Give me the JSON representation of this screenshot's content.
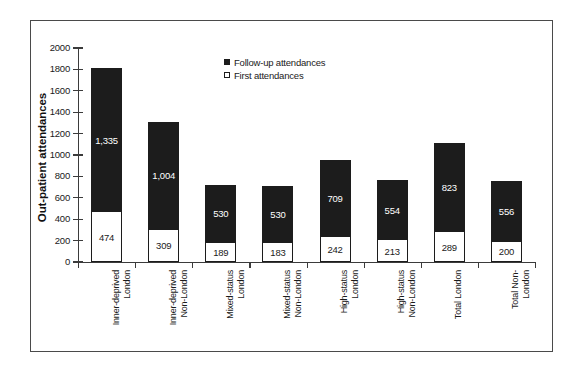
{
  "chart_data": {
    "type": "bar",
    "subtype": "stacked-vertical",
    "title": "",
    "xlabel": "",
    "ylabel": "Out-patient attendances",
    "ylim": [
      0,
      2000
    ],
    "ytick_step": 200,
    "yticks": [
      "0",
      "200",
      "400",
      "600",
      "800",
      "1000",
      "1200",
      "1400",
      "1600",
      "1800",
      "2000"
    ],
    "grid": false,
    "legend_position": "top-center",
    "categories": [
      "Inner-deprived\nLondon",
      "Inner-deprived\nNon-London",
      "Mixed-status\nLondon",
      "Mixed-status\nNon-London",
      "High-status\nLondon",
      "High-status\nNon-London",
      "Total London",
      "Total Non-\nLondon"
    ],
    "series": [
      {
        "name": "First attendances",
        "color": "#ffffff",
        "values": [
          474,
          309,
          189,
          183,
          242,
          213,
          289,
          200
        ],
        "labels": [
          "474",
          "309",
          "189",
          "183",
          "242",
          "213",
          "289",
          "200"
        ]
      },
      {
        "name": "Follow-up attendances",
        "color": "#1c1c1c",
        "values": [
          1335,
          1004,
          530,
          530,
          709,
          554,
          823,
          556
        ],
        "labels": [
          "1,335",
          "1,004",
          "530",
          "530",
          "709",
          "554",
          "823",
          "556"
        ]
      }
    ],
    "totals": [
      1809,
      1313,
      719,
      713,
      951,
      767,
      1112,
      756
    ]
  },
  "legend": {
    "items": [
      {
        "label": "Follow-up attendances",
        "swatch": "filled"
      },
      {
        "label": "First attendances",
        "swatch": "hollow"
      }
    ]
  }
}
